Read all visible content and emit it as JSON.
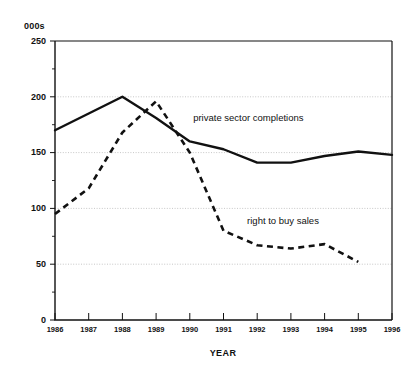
{
  "chart_data": {
    "type": "line",
    "title": "",
    "subtitle": "",
    "unit_label": "000s",
    "xlabel": "YEAR",
    "ylabel": "",
    "x": [
      1986,
      1987,
      1988,
      1989,
      1990,
      1991,
      1992,
      1993,
      1994,
      1995,
      1996
    ],
    "categories": [
      "1986",
      "1987",
      "1988",
      "1989",
      "1990",
      "1991",
      "1992",
      "1993",
      "1994",
      "1995",
      "1996"
    ],
    "xlim": [
      1986,
      1996
    ],
    "ylim": [
      0,
      250
    ],
    "yticks": [
      0,
      50,
      100,
      150,
      200,
      250
    ],
    "ytick_labels": [
      "0",
      "50",
      "100",
      "150",
      "200",
      "250"
    ],
    "y_minor_tick_step": 25,
    "grid": "horizontal-dotted",
    "legend": "inline-annotations",
    "series": [
      {
        "name": "private sector completions",
        "style": "solid",
        "color": "#111111",
        "values": [
          170,
          185,
          200,
          181,
          160,
          153,
          141,
          141,
          147,
          151,
          148
        ]
      },
      {
        "name": "right to buy sales",
        "style": "dashed",
        "color": "#111111",
        "values": [
          95,
          118,
          168,
          196,
          150,
          80,
          67,
          64,
          68,
          52,
          null
        ]
      }
    ],
    "annotations": [
      {
        "text": "private sector completions",
        "series": "private sector completions",
        "x": 1990.1,
        "y": 178
      },
      {
        "text": "right to buy sales",
        "series": "right to buy sales",
        "x": 1991.7,
        "y": 86
      }
    ]
  }
}
